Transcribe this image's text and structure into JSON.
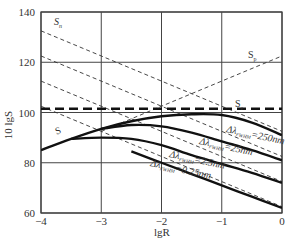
{
  "chart_data": {
    "type": "line",
    "title": "",
    "xlabel": "lgR",
    "ylabel": "10 lgS",
    "xlim": [
      -4,
      0
    ],
    "ylim": [
      60,
      140
    ],
    "grid": true,
    "x_ticks": [
      "-4",
      "-3",
      "-2",
      "-1",
      "0"
    ],
    "y_ticks": [
      "60",
      "80",
      "100",
      "120",
      "140"
    ],
    "series": [
      {
        "name": "S_n (dashed reference)",
        "style": "thin-dashed",
        "x": [
          -4,
          0
        ],
        "y": [
          132.5,
          92.5
        ]
      },
      {
        "name": "dashed reference 2",
        "style": "thin-dashed",
        "x": [
          -4,
          0
        ],
        "y": [
          122.5,
          82.5
        ]
      },
      {
        "name": "dashed reference 3",
        "style": "thin-dashed",
        "x": [
          -4,
          0
        ],
        "y": [
          112.5,
          72.5
        ]
      },
      {
        "name": "dashed reference 4",
        "style": "thin-dashed",
        "x": [
          -4,
          0
        ],
        "y": [
          102.5,
          62.5
        ]
      },
      {
        "name": "S_p",
        "style": "thin-dashed",
        "x": [
          -3,
          0
        ],
        "y": [
          92.5,
          122.5
        ]
      },
      {
        "name": "S_e",
        "style": "thick-dashed",
        "x": [
          -4,
          0
        ],
        "y": [
          101.5,
          101.5
        ]
      },
      {
        "name": "Δλ_FWHM=250nm",
        "style": "solid",
        "x": [
          -4,
          -3.5,
          -3,
          -2.5,
          -2,
          -1.5,
          -1,
          -0.5,
          0
        ],
        "y": [
          85,
          89.5,
          93.5,
          96.5,
          98.5,
          99.3,
          99,
          96,
          91
        ]
      },
      {
        "name": "Δλ_FWHM=25nm",
        "style": "solid",
        "x": [
          -3,
          -2.5,
          -2,
          -1.5,
          -1,
          -0.5,
          0
        ],
        "y": [
          93.5,
          95,
          94.5,
          92,
          88.5,
          85,
          81
        ]
      },
      {
        "name": "Δλ_FWHM=2.5nm",
        "style": "solid",
        "x": [
          -3.5,
          -3,
          -2.5,
          -2,
          -1.5,
          -1,
          -0.5,
          0
        ],
        "y": [
          89.5,
          90,
          89.5,
          87,
          83,
          79.5,
          76,
          72
        ]
      },
      {
        "name": "Δλ_FWHM=0.25nm",
        "style": "solid",
        "x": [
          -2.5,
          -2,
          -1.5,
          -1,
          -0.5,
          0
        ],
        "y": [
          84.5,
          80,
          75.5,
          71,
          66.5,
          62
        ]
      }
    ],
    "annotations": [
      {
        "text": "S",
        "sub": "n",
        "x": -3.75,
        "y": 135.5
      },
      {
        "text": "S",
        "sub": "p",
        "x": -0.55,
        "y": 119
      },
      {
        "text": "S",
        "sub": "e",
        "x": -0.7,
        "y": 103.5
      },
      {
        "text": "S",
        "sub": "",
        "x": -3.65,
        "y": 93
      },
      {
        "text": "Δλ",
        "sub": "FWHM",
        "suffix": "=250nm",
        "x": -0.75,
        "y": 93
      },
      {
        "text": "Δλ",
        "sub": "FWHM",
        "suffix": "=25nm",
        "x": -1.3,
        "y": 86.5
      },
      {
        "text": "Δλ",
        "sub": "FWHM",
        "suffix": "=2.5nm",
        "x": -2.05,
        "y": 80.5
      },
      {
        "text": "Δλ",
        "sub": "FWHM",
        "suffix": "=0.25nm",
        "x": -2.5,
        "y": 76
      }
    ]
  },
  "labels": {
    "xlabel": "lgR",
    "ylabel": "10 lgS",
    "sn": "S",
    "sn_sub": "n",
    "sp": "S",
    "sp_sub": "p",
    "se": "S",
    "se_sub": "e",
    "s": "S",
    "c250": "Δλ",
    "c250_sub": "FWHM",
    "c250_val": "=250nm",
    "c25": "Δλ",
    "c25_sub": "FWHM",
    "c25_val": "=25nm",
    "c2_5": "Δλ",
    "c2_5_sub": "FWHM",
    "c2_5_val": "=2.5nm",
    "c0_25": "Δλ",
    "c0_25_sub": "FWHM",
    "c0_25_val": "=0.25nm"
  }
}
